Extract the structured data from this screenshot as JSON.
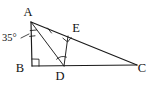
{
  "figure": {
    "canvas": {
      "width": 158,
      "height": 89,
      "background": "#ffffff"
    },
    "stroke_color": "#1a1a1a",
    "vertices": [
      {
        "id": "A",
        "label": "A",
        "x": 31,
        "y": 22,
        "label_x": 28,
        "label_y": 16
      },
      {
        "id": "B",
        "label": "B",
        "x": 32,
        "y": 66,
        "label_x": 20,
        "label_y": 72
      },
      {
        "id": "C",
        "label": "C",
        "x": 137,
        "y": 65,
        "label_x": 142,
        "label_y": 72
      },
      {
        "id": "D",
        "label": "D",
        "x": 64,
        "y": 66,
        "label_x": 60,
        "label_y": 80
      },
      {
        "id": "E",
        "label": "E",
        "x": 68,
        "y": 36,
        "label_x": 76,
        "label_y": 32
      }
    ],
    "segments": [
      {
        "id": "AB",
        "from": "A",
        "to": "B",
        "kind": "side"
      },
      {
        "id": "BC",
        "from": "B",
        "to": "C",
        "kind": "side"
      },
      {
        "id": "AC",
        "from": "A",
        "to": "C",
        "kind": "side"
      },
      {
        "id": "AD",
        "from": "A",
        "to": "D",
        "kind": "cevian"
      },
      {
        "id": "DE",
        "from": "D",
        "to": "E",
        "kind": "perpendicular"
      }
    ],
    "angle_label": {
      "id": "angle-at-A",
      "value": "35",
      "degree_symbol": "°",
      "text": "35°",
      "at_vertex": "A",
      "label_x": 3,
      "label_y": 41,
      "leader_from_x": 21,
      "leader_from_y": 38,
      "leader_to_x": 29,
      "leader_to_y": 34
    },
    "marks": [
      {
        "id": "right-angle-B",
        "type": "right-angle-square",
        "at": "B",
        "size": 7
      },
      {
        "id": "right-angle-E",
        "type": "right-angle-square",
        "at": "E",
        "size": 6
      },
      {
        "id": "angle-arc-D",
        "type": "angle-arc",
        "at": "D"
      },
      {
        "id": "angle-ticks-A",
        "type": "bisector-ticks",
        "at": "A",
        "count": 2
      },
      {
        "id": "congruence-tick-AE",
        "type": "segment-tick",
        "on": "AE",
        "count": 1
      }
    ]
  }
}
